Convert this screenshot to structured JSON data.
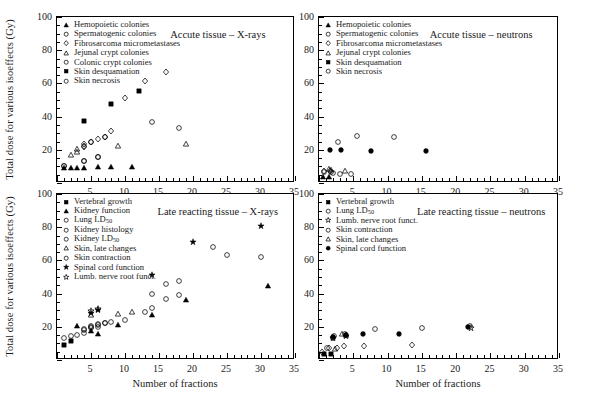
{
  "figure": {
    "y_axis_label": "Total dose for various isoeffects (Gy)",
    "x_axis_label": "Number of fractions"
  },
  "axes": {
    "x": {
      "min": 0,
      "max": 35,
      "ticks": [
        0,
        5,
        10,
        15,
        20,
        25,
        30,
        35
      ],
      "tick_labels": [
        "",
        "5",
        "10",
        "15",
        "20",
        "25",
        "30",
        "35"
      ],
      "minor_step": 1
    },
    "y": {
      "min": 0,
      "max": 100,
      "ticks": [
        0,
        20,
        40,
        60,
        80,
        100
      ],
      "tick_labels": [
        "",
        "20",
        "40",
        "60",
        "80",
        "100"
      ],
      "minor_step": 5
    }
  },
  "chart_data": [
    {
      "id": "acute-xrays",
      "type": "scatter",
      "title": "Accute tissue – X-rays",
      "position": "top-left",
      "xlabel": "Number of fractions",
      "ylabel": "Total dose for various isoeffects (Gy)",
      "xlim": [
        0,
        35
      ],
      "ylim": [
        0,
        100
      ],
      "grid": false,
      "legend_position": "top-left",
      "series": [
        {
          "name": "Hemopoietic colonies",
          "marker": "triangle-filled",
          "points": [
            [
              1,
              9.0
            ],
            [
              2,
              9.2
            ],
            [
              3,
              9.3
            ],
            [
              4,
              9.3
            ],
            [
              6,
              9.5
            ],
            [
              8,
              9.6
            ],
            [
              11,
              9.6
            ]
          ]
        },
        {
          "name": "Spermatogenic colonies",
          "marker": "circle-open",
          "points": [
            [
              1,
              10.5
            ],
            [
              4,
              13.5
            ],
            [
              6,
              15.8
            ]
          ]
        },
        {
          "name": "Fibrosarcoma micrometastases",
          "marker": "diamond-open",
          "points": [
            [
              4,
              21.5
            ],
            [
              4,
              22.5
            ],
            [
              4,
              23.5
            ],
            [
              5,
              24.5
            ],
            [
              6,
              26.5
            ],
            [
              7,
              27.5
            ],
            [
              8,
              31.5
            ],
            [
              10,
              51.5
            ],
            [
              13,
              61.5
            ],
            [
              16,
              67.0
            ]
          ]
        },
        {
          "name": "Jejunal crypt colonies",
          "marker": "triangle-open",
          "points": [
            [
              2,
              17.0
            ],
            [
              3,
              18.5
            ],
            [
              3,
              20.5
            ],
            [
              9,
              22.5
            ],
            [
              19,
              23.5
            ]
          ]
        },
        {
          "name": "Colonic crypt colonies",
          "marker": "circle-open",
          "points": [
            [
              5,
              24.5
            ],
            [
              7,
              27.8
            ],
            [
              14,
              36.5
            ],
            [
              18,
              33.0
            ]
          ]
        },
        {
          "name": "Skin desquamation",
          "marker": "square-filled",
          "points": [
            [
              4,
              37.5
            ],
            [
              8,
              47.5
            ],
            [
              12,
              55.5
            ]
          ]
        },
        {
          "name": "Skin necrosis",
          "marker": "circle-open",
          "points": [
            [
              1,
              10.5
            ],
            [
              4,
              13.5
            ],
            [
              6,
              15.8
            ]
          ]
        }
      ]
    },
    {
      "id": "acute-neutrons",
      "type": "scatter",
      "title": "Accute tissue – neutrons",
      "position": "top-right",
      "xlabel": "Number of fractions",
      "ylabel": "Total dose for various isoeffects (Gy)",
      "xlim": [
        0,
        35
      ],
      "ylim": [
        0,
        100
      ],
      "grid": false,
      "legend_position": "top-left",
      "series": [
        {
          "name": "Hemopoietic colonies",
          "marker": "triangle-filled",
          "points": [
            [
              0.6,
              3.5
            ],
            [
              1.5,
              3.6
            ]
          ]
        },
        {
          "name": "Spermatogenic colonies",
          "marker": "circle-open",
          "points": [
            [
              0.7,
              6.5
            ],
            [
              1.7,
              6.6
            ],
            [
              2.0,
              6.2
            ],
            [
              3.0,
              5.2
            ],
            [
              4.6,
              5.4
            ]
          ]
        },
        {
          "name": "Fibrosarcoma micrometastases",
          "marker": "diamond-open",
          "points": [
            [
              0.7,
              7.3
            ],
            [
              1.6,
              7.4
            ]
          ]
        },
        {
          "name": "Jejunal crypt colonies",
          "marker": "triangle-open",
          "points": [
            [
              1.5,
              8.2
            ],
            [
              1.8,
              7.8
            ],
            [
              3.8,
              7.0
            ]
          ]
        },
        {
          "name": "Skin desquamation",
          "marker": "circle-filled",
          "points": [
            [
              1.6,
              19.8
            ],
            [
              3.2,
              19.6
            ],
            [
              7.6,
              19.2
            ],
            [
              15.6,
              19.3
            ]
          ]
        },
        {
          "name": "Skin necrosis",
          "marker": "circle-open",
          "points": [
            [
              2.8,
              25.0
            ],
            [
              5.5,
              28.5
            ],
            [
              11.0,
              28.0
            ]
          ]
        }
      ]
    },
    {
      "id": "late-xrays",
      "type": "scatter",
      "title": "Late reacting tissue – X-rays",
      "position": "bottom-left",
      "xlabel": "Number of fractions",
      "ylabel": "Total dose for various isoeffects (Gy)",
      "xlim": [
        0,
        35
      ],
      "ylim": [
        0,
        100
      ],
      "grid": false,
      "legend_position": "top-left",
      "series": [
        {
          "name": "Vertebral growth",
          "marker": "square-filled",
          "points": [
            [
              1,
              9.0
            ],
            [
              2,
              11.5
            ]
          ]
        },
        {
          "name": "Kidney function",
          "marker": "triangle-filled",
          "points": [
            [
              3,
              20.5
            ],
            [
              5,
              17.5
            ],
            [
              6,
              15.5
            ],
            [
              9,
              21.0
            ],
            [
              14,
              27.0
            ],
            [
              19,
              36.0
            ],
            [
              31,
              44.5
            ]
          ]
        },
        {
          "name": "Lung LD50",
          "marker": "circle-open",
          "points": [
            [
              1,
              13.0
            ],
            [
              2,
              14.5
            ],
            [
              3,
              15.0
            ],
            [
              4,
              16.5
            ],
            [
              4,
              18.5
            ],
            [
              5,
              20.5
            ],
            [
              6,
              21.5
            ],
            [
              8,
              23.0
            ]
          ]
        },
        {
          "name": "Kidney histology",
          "marker": "circle-open",
          "points": [
            [
              5,
              19.0
            ],
            [
              6,
              20.0
            ],
            [
              7,
              22.5
            ],
            [
              10,
              24.0
            ],
            [
              13,
              29.0
            ],
            [
              14,
              31.5
            ],
            [
              16,
              36.5
            ],
            [
              18,
              39.0
            ]
          ]
        },
        {
          "name": "Kidney LD50",
          "marker": "circle-open",
          "points": [
            [
              14,
              40.0
            ],
            [
              16,
              45.5
            ],
            [
              18,
              47.5
            ],
            [
              23,
              68.0
            ],
            [
              25,
              63.0
            ],
            [
              30,
              62.0
            ]
          ]
        },
        {
          "name": "Skin, late changes",
          "marker": "triangle-open",
          "points": [
            [
              5,
              27.0
            ],
            [
              9,
              27.5
            ],
            [
              11,
              29.0
            ]
          ]
        },
        {
          "name": "Skin contraction",
          "marker": "circle-open",
          "points": [
            [
              4,
              18.0
            ],
            [
              5,
              20.0
            ],
            [
              6,
              21.0
            ],
            [
              7,
              22.0
            ]
          ]
        },
        {
          "name": "Spinal cord function",
          "marker": "star-filled",
          "points": [
            [
              5,
              28.5
            ],
            [
              6,
              30.0
            ],
            [
              14,
              51.5
            ],
            [
              20,
              71.0
            ],
            [
              30,
              80.5
            ]
          ]
        },
        {
          "name": "Lumb. nerve root funct.",
          "marker": "star-open",
          "points": [
            [
              5,
              29.5
            ],
            [
              6,
              31.0
            ]
          ]
        }
      ]
    },
    {
      "id": "late-neutrons",
      "type": "scatter",
      "title": "Late reacting tissue – neutrons",
      "position": "bottom-right",
      "xlabel": "Number of fractions",
      "ylabel": "Total dose for various isoeffects (Gy)",
      "xlim": [
        0,
        35
      ],
      "ylim": [
        0,
        100
      ],
      "grid": false,
      "legend_position": "top-left",
      "series": [
        {
          "name": "Vertebral growth",
          "marker": "square-filled",
          "points": [
            [
              0.8,
              3.5
            ],
            [
              1.8,
              3.6
            ]
          ]
        },
        {
          "name": "Lung LD50",
          "marker": "circle-open",
          "points": [
            [
              1.2,
              7.5
            ],
            [
              2.0,
              13.5
            ],
            [
              2.2,
              14.5
            ],
            [
              3.8,
              15.5
            ],
            [
              8.2,
              18.5
            ],
            [
              15.0,
              19.5
            ],
            [
              22.0,
              20.5
            ]
          ]
        },
        {
          "name": "Lumb. nerve root funct.",
          "marker": "star-open",
          "points": [
            [
              2.1,
              13.0
            ],
            [
              3.9,
              14.5
            ],
            [
              22.2,
              19.0
            ]
          ]
        },
        {
          "name": "Skin contraction",
          "marker": "diamond-open",
          "points": [
            [
              0.5,
              5.0
            ],
            [
              1.4,
              7.0
            ],
            [
              2.6,
              7.2
            ],
            [
              3.6,
              8.5
            ],
            [
              6.5,
              8.5
            ],
            [
              13.5,
              8.8
            ]
          ]
        },
        {
          "name": "Skin, late changes",
          "marker": "triangle-open",
          "points": [
            [
              2.4,
              6.5
            ],
            [
              3.4,
              15.5
            ],
            [
              4.0,
              15.2
            ]
          ]
        },
        {
          "name": "Spinal cord function",
          "marker": "circle-filled",
          "points": [
            [
              2.1,
              14.0
            ],
            [
              3.9,
              15.0
            ],
            [
              6.4,
              15.5
            ],
            [
              11.6,
              15.5
            ],
            [
              21.8,
              19.8
            ]
          ]
        }
      ]
    }
  ],
  "legends": {
    "acute_xrays": [
      {
        "marker": "triangle-filled",
        "label": "Hemopoietic colonies"
      },
      {
        "marker": "circle-open",
        "label": "Spermatogenic colonies"
      },
      {
        "marker": "diamond-open",
        "label": "Fibrosarcoma micrometastases"
      },
      {
        "marker": "triangle-open",
        "label": "Jejunal crypt colonies"
      },
      {
        "marker": "circle-open",
        "label": "Colonic crypt colonies"
      },
      {
        "marker": "square-filled",
        "label": "Skin desquamation"
      },
      {
        "marker": "circle-open",
        "label": "Skin necrosis"
      }
    ],
    "acute_neutrons": [
      {
        "marker": "triangle-filled",
        "label": "Hemopoietic colonies"
      },
      {
        "marker": "circle-open",
        "label": "Spermatogenic colonies"
      },
      {
        "marker": "diamond-open",
        "label": "Fibrosarcoma micrometastases"
      },
      {
        "marker": "triangle-open",
        "label": "Jejunal crypt colonies"
      },
      {
        "marker": "square-filled",
        "label": "Skin desquamation"
      },
      {
        "marker": "circle-open",
        "label": "Skin necrosis"
      }
    ],
    "late_xrays": [
      {
        "marker": "square-filled",
        "label": "Vertebral growth"
      },
      {
        "marker": "triangle-filled",
        "label": "Kidney function"
      },
      {
        "marker": "circle-open",
        "label": "Lung LD",
        "sub": "50"
      },
      {
        "marker": "circle-open",
        "label": "Kidney histology"
      },
      {
        "marker": "circle-open",
        "label": "Kidney LD",
        "sub": "50"
      },
      {
        "marker": "triangle-open",
        "label": "Skin, late changes"
      },
      {
        "marker": "circle-open",
        "label": "Skin contraction"
      },
      {
        "marker": "star-filled",
        "label": "Spinal cord function"
      },
      {
        "marker": "star-open",
        "label": "Lumb. nerve root funct."
      }
    ],
    "late_neutrons": [
      {
        "marker": "square-filled",
        "label": "Vertebral growth"
      },
      {
        "marker": "circle-open",
        "label": "Lung LD",
        "sub": "50"
      },
      {
        "marker": "star-open",
        "label": "Lumb. nerve root funct."
      },
      {
        "marker": "circle-open",
        "label": "Skin contraction"
      },
      {
        "marker": "triangle-open",
        "label": "Skin, late changes"
      },
      {
        "marker": "circle-filled",
        "label": "Spinal cord function"
      }
    ]
  }
}
